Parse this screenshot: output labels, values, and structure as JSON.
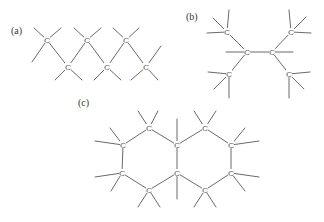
{
  "figure": {
    "colors": {
      "bond": "#6a6a6a",
      "atom": "#555555",
      "label": "#333333",
      "background": "#ffffff"
    },
    "panels": [
      {
        "id": "a",
        "label": "(a)",
        "label_pos": [
          11,
          34
        ],
        "atom_symbol": "C",
        "atoms": [
          [
            47,
            40
          ],
          [
            87,
            40
          ],
          [
            126,
            40
          ],
          [
            68,
            67
          ],
          [
            107,
            67
          ],
          [
            146,
            67
          ]
        ],
        "bonds": [
          [
            [
              47,
              40
            ],
            [
              68,
              67
            ]
          ],
          [
            [
              68,
              67
            ],
            [
              87,
              40
            ]
          ],
          [
            [
              87,
              40
            ],
            [
              107,
              67
            ]
          ],
          [
            [
              107,
              67
            ],
            [
              126,
              40
            ]
          ],
          [
            [
              126,
              40
            ],
            [
              146,
              67
            ]
          ],
          [
            [
              47,
              40
            ],
            [
              34,
              28
            ]
          ],
          [
            [
              47,
              40
            ],
            [
              61,
              28
            ]
          ],
          [
            [
              47,
              40
            ],
            [
              32,
              62
            ]
          ],
          [
            [
              68,
              67
            ],
            [
              55,
              80
            ]
          ],
          [
            [
              68,
              67
            ],
            [
              82,
              80
            ]
          ],
          [
            [
              87,
              40
            ],
            [
              74,
              28
            ]
          ],
          [
            [
              87,
              40
            ],
            [
              101,
              28
            ]
          ],
          [
            [
              107,
              67
            ],
            [
              94,
              80
            ]
          ],
          [
            [
              107,
              67
            ],
            [
              121,
              80
            ]
          ],
          [
            [
              126,
              40
            ],
            [
              113,
              28
            ]
          ],
          [
            [
              126,
              40
            ],
            [
              139,
              28
            ]
          ],
          [
            [
              146,
              67
            ],
            [
              161,
              46
            ]
          ],
          [
            [
              146,
              67
            ],
            [
              158,
              80
            ]
          ],
          [
            [
              146,
              67
            ],
            [
              131,
              80
            ]
          ]
        ]
      },
      {
        "id": "b",
        "label": "(b)",
        "label_pos": [
          186,
          20
        ],
        "atom_symbol": "C",
        "atoms": [
          [
            227,
            32
          ],
          [
            247,
            52
          ],
          [
            272,
            52
          ],
          [
            291,
            32
          ],
          [
            229,
            74
          ],
          [
            289,
            74
          ]
        ],
        "bonds": [
          [
            [
              227,
              32
            ],
            [
              247,
              52
            ]
          ],
          [
            [
              247,
              52
            ],
            [
              272,
              52
            ]
          ],
          [
            [
              272,
              52
            ],
            [
              291,
              32
            ]
          ],
          [
            [
              247,
              52
            ],
            [
              229,
              74
            ]
          ],
          [
            [
              272,
              52
            ],
            [
              289,
              74
            ]
          ],
          [
            [
              247,
              52
            ],
            [
              226,
              52
            ]
          ],
          [
            [
              272,
              52
            ],
            [
              293,
              52
            ]
          ],
          [
            [
              227,
              32
            ],
            [
              213,
              18
            ]
          ],
          [
            [
              227,
              32
            ],
            [
              229,
              10
            ]
          ],
          [
            [
              227,
              32
            ],
            [
              207,
              33
            ]
          ],
          [
            [
              291,
              32
            ],
            [
              289,
              10
            ]
          ],
          [
            [
              291,
              32
            ],
            [
              306,
              17
            ]
          ],
          [
            [
              291,
              32
            ],
            [
              311,
              33
            ]
          ],
          [
            [
              229,
              74
            ],
            [
              208,
              72
            ]
          ],
          [
            [
              229,
              74
            ],
            [
              214,
              89
            ]
          ],
          [
            [
              229,
              74
            ],
            [
              229,
              98
            ]
          ],
          [
            [
              289,
              74
            ],
            [
              310,
              72
            ]
          ],
          [
            [
              289,
              74
            ],
            [
              304,
              89
            ]
          ],
          [
            [
              289,
              74
            ],
            [
              289,
              98
            ]
          ]
        ]
      },
      {
        "id": "c",
        "label": "(c)",
        "label_pos": [
          78,
          106
        ],
        "atom_symbol": "C",
        "atoms": [
          [
            149,
            128
          ],
          [
            123,
            145
          ],
          [
            122,
            173
          ],
          [
            149,
            190
          ],
          [
            177,
            145
          ],
          [
            177,
            173
          ],
          [
            205,
            128
          ],
          [
            231,
            145
          ],
          [
            231,
            173
          ],
          [
            205,
            190
          ]
        ],
        "bonds": [
          [
            [
              149,
              128
            ],
            [
              123,
              145
            ]
          ],
          [
            [
              123,
              145
            ],
            [
              122,
              173
            ]
          ],
          [
            [
              122,
              173
            ],
            [
              149,
              190
            ]
          ],
          [
            [
              149,
              190
            ],
            [
              177,
              173
            ]
          ],
          [
            [
              177,
              173
            ],
            [
              177,
              145
            ]
          ],
          [
            [
              177,
              145
            ],
            [
              149,
              128
            ]
          ],
          [
            [
              177,
              145
            ],
            [
              205,
              128
            ]
          ],
          [
            [
              205,
              128
            ],
            [
              231,
              145
            ]
          ],
          [
            [
              231,
              145
            ],
            [
              231,
              173
            ]
          ],
          [
            [
              231,
              173
            ],
            [
              205,
              190
            ]
          ],
          [
            [
              205,
              190
            ],
            [
              177,
              173
            ]
          ],
          [
            [
              149,
              128
            ],
            [
              138,
              111
            ]
          ],
          [
            [
              149,
              128
            ],
            [
              158,
              111
            ]
          ],
          [
            [
              123,
              145
            ],
            [
              95,
              141
            ]
          ],
          [
            [
              123,
              145
            ],
            [
              110,
              128
            ]
          ],
          [
            [
              122,
              173
            ],
            [
              95,
              177
            ]
          ],
          [
            [
              122,
              173
            ],
            [
              111,
              191
            ]
          ],
          [
            [
              149,
              190
            ],
            [
              138,
              207
            ]
          ],
          [
            [
              149,
              190
            ],
            [
              160,
              207
            ]
          ],
          [
            [
              177,
              145
            ],
            [
              177,
              119
            ]
          ],
          [
            [
              177,
              173
            ],
            [
              177,
              199
            ]
          ],
          [
            [
              205,
              128
            ],
            [
              194,
              111
            ]
          ],
          [
            [
              205,
              128
            ],
            [
              216,
              111
            ]
          ],
          [
            [
              231,
              145
            ],
            [
              259,
              141
            ]
          ],
          [
            [
              231,
              145
            ],
            [
              245,
              128
            ]
          ],
          [
            [
              231,
              173
            ],
            [
              259,
              177
            ]
          ],
          [
            [
              231,
              173
            ],
            [
              245,
              191
            ]
          ],
          [
            [
              205,
              190
            ],
            [
              194,
              207
            ]
          ],
          [
            [
              205,
              190
            ],
            [
              216,
              207
            ]
          ]
        ]
      }
    ]
  }
}
